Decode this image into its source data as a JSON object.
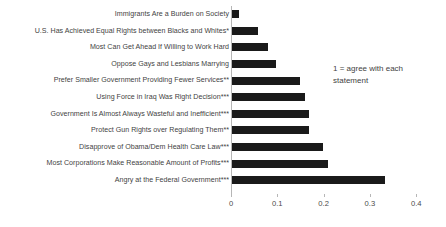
{
  "chart_data": {
    "type": "bar",
    "orientation": "horizontal",
    "title": "",
    "xlabel": "",
    "ylabel": "",
    "xlim": [
      0,
      0.4
    ],
    "xticks": [
      "0",
      "0.1",
      "0.2",
      "0.3",
      "0.4"
    ],
    "xtick_values": [
      0,
      0.1,
      0.2,
      0.3,
      0.4
    ],
    "grid": false,
    "legend": false,
    "bar_color": "#1a1a1a",
    "categories": [
      "Immigrants Are a Burden on Society",
      "U.S. Has Achieved Equal Rights between Blacks and Whites*",
      "Most Can Get Ahead If Willing to Work Hard",
      "Oppose Gays and Lesbians Marrying",
      "Prefer Smaller Government Providing Fewer Services**",
      "Using Force in Iraq Was Right Decision***",
      "Government Is Almost Always Wasteful and Inefficient***",
      "Protect Gun Rights over Regulating Them**",
      "Disapprove of Obama/Dem Health Care Law***",
      "Most Corporations Make Reasonable Amount of Profits***",
      "Angry at the Federal Government***"
    ],
    "values": [
      0.015,
      0.057,
      0.078,
      0.096,
      0.146,
      0.157,
      0.167,
      0.167,
      0.196,
      0.208,
      0.33
    ],
    "annotations": [
      "1 = agree with each",
      "statement"
    ]
  }
}
